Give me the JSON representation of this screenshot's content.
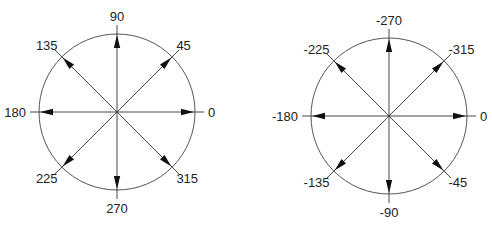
{
  "diagrams": [
    {
      "name": "positive-angles",
      "center": [
        117,
        112
      ],
      "radius": 78,
      "labels": [
        {
          "angle": 0,
          "text": "0"
        },
        {
          "angle": 45,
          "text": "45"
        },
        {
          "angle": 90,
          "text": "90"
        },
        {
          "angle": 135,
          "text": "135"
        },
        {
          "angle": 180,
          "text": "180"
        },
        {
          "angle": 225,
          "text": "225"
        },
        {
          "angle": 270,
          "text": "270"
        },
        {
          "angle": 315,
          "text": "315"
        }
      ]
    },
    {
      "name": "negative-angles",
      "center": [
        389,
        116
      ],
      "radius": 78,
      "labels": [
        {
          "angle": 0,
          "text": "0"
        },
        {
          "angle": 45,
          "text": "-315"
        },
        {
          "angle": 90,
          "text": "-270"
        },
        {
          "angle": 135,
          "text": "-225"
        },
        {
          "angle": 180,
          "text": "-180"
        },
        {
          "angle": 225,
          "text": "-135"
        },
        {
          "angle": 270,
          "text": "-90"
        },
        {
          "angle": 315,
          "text": "-45"
        }
      ]
    }
  ],
  "colors": {
    "line": "#333333",
    "circle": "#555555",
    "text": "#222222"
  }
}
